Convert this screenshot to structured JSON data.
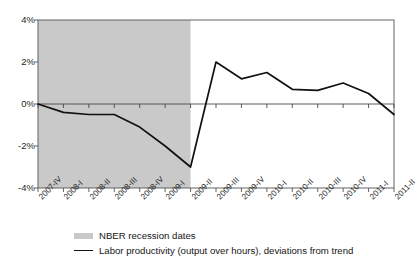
{
  "chart_data": {
    "type": "line",
    "title": "",
    "xlabel": "",
    "ylabel": "",
    "ylim": [
      -4,
      4
    ],
    "ytick_values": [
      4,
      2,
      0,
      -2,
      -4
    ],
    "ytick_labels": [
      "4%",
      "2%",
      "0%",
      "-2%",
      "-4%"
    ],
    "grid": false,
    "legend_position": "bottom",
    "categories": [
      "2007-IV",
      "2008-I",
      "2008-II",
      "2008-III",
      "2008-IV",
      "2009-I",
      "2009-II",
      "2009-III",
      "2009-IV",
      "2010-I",
      "2010-II",
      "2010-III",
      "2010-IV",
      "2011-I",
      "2011-II"
    ],
    "series": [
      {
        "name": "Labor productivity (output over hours), deviations from trend",
        "color": "#111111",
        "values": [
          0.0,
          -0.4,
          -0.5,
          -0.5,
          -1.1,
          -2.0,
          -3.0,
          2.0,
          1.2,
          1.5,
          0.7,
          0.65,
          1.0,
          0.5,
          -0.5
        ]
      }
    ],
    "shaded_regions": [
      {
        "name": "NBER recession dates",
        "start_category": "2007-IV",
        "end_category": "2009-II",
        "color": "#c9c9c9"
      }
    ],
    "zero_line": 0
  },
  "legend": {
    "items": [
      {
        "label": "NBER recession dates",
        "marker": "band",
        "color": "#c9c9c9"
      },
      {
        "label": "Labor productivity (output over hours), deviations from trend",
        "marker": "line",
        "color": "#111111"
      }
    ]
  },
  "axes": {
    "frame_color": "#555555",
    "tick_color": "#555555"
  }
}
